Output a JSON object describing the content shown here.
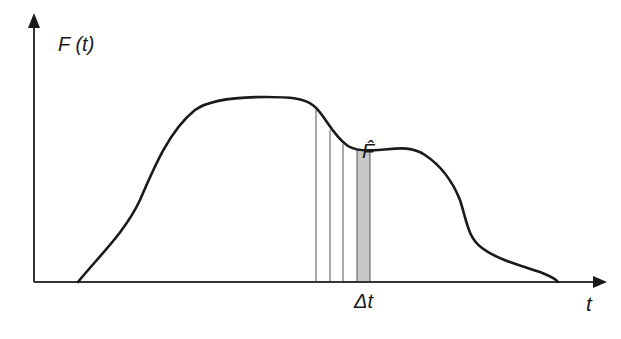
{
  "diagram": {
    "type": "function-curve-with-sampling-strips",
    "y_axis": {
      "label": "F (t)"
    },
    "x_axis": {
      "label": "t"
    },
    "curve": {
      "description": "Rising S-shaped curve to a flat plateau, dips to a local minimum (marked F-hat), small second hump, then decays to zero",
      "points": [
        [
          78,
          282
        ],
        [
          120,
          230
        ],
        [
          150,
          175
        ],
        [
          185,
          120
        ],
        [
          215,
          100
        ],
        [
          260,
          97
        ],
        [
          300,
          100
        ],
        [
          318,
          112
        ],
        [
          330,
          130
        ],
        [
          345,
          145
        ],
        [
          360,
          150
        ],
        [
          380,
          150
        ],
        [
          405,
          148
        ],
        [
          425,
          155
        ],
        [
          440,
          170
        ],
        [
          458,
          195
        ],
        [
          467,
          222
        ],
        [
          480,
          245
        ],
        [
          500,
          258
        ],
        [
          530,
          270
        ],
        [
          556,
          280
        ]
      ]
    },
    "vertical_lines_x": [
      316,
      330,
      343
    ],
    "shaded_strip": {
      "x_start": 357,
      "x_end": 370,
      "color": "#c8c8c8",
      "label": "Δt"
    },
    "marker_label": "F̂",
    "colors": {
      "curve": "#1a1a1a",
      "axis": "#333333",
      "strip_fill": "#c8c8c8",
      "thin_lines": "#555555"
    }
  },
  "labels": {
    "y_axis": "F (t)",
    "x_axis": "t",
    "delta_t": "Δt",
    "f_hat": "F̂"
  }
}
